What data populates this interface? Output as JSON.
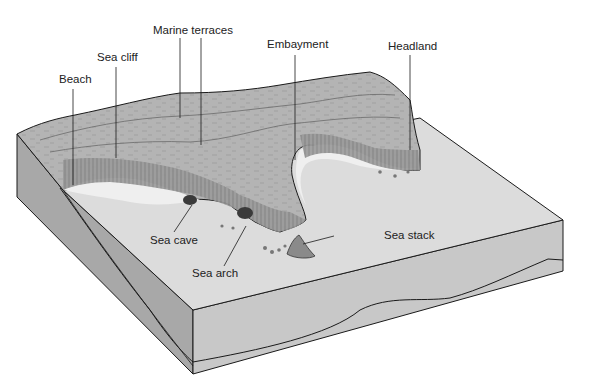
{
  "diagram": {
    "colors": {
      "background": "#ffffff",
      "sea_floor": "#dcdcdc",
      "land_top": "#b4b4b4",
      "terrace": "#c2c2c2",
      "cliff_face": "#9a9a9a",
      "beach": "#efefef",
      "front_face": "#c8c8c8",
      "left_face": "#a8a8a8",
      "outline": "#1a1a1a"
    },
    "labels": [
      {
        "id": "marine-terraces",
        "text": "Marine terraces",
        "x": 153,
        "y": 25
      },
      {
        "id": "sea-cliff",
        "text": "Sea cliff",
        "x": 97,
        "y": 52
      },
      {
        "id": "beach",
        "text": "Beach",
        "x": 59,
        "y": 74
      },
      {
        "id": "embayment",
        "text": "Embayment",
        "x": 267,
        "y": 39
      },
      {
        "id": "headland",
        "text": "Headland",
        "x": 388,
        "y": 41
      },
      {
        "id": "sea-cave",
        "text": "Sea cave",
        "x": 150,
        "y": 235
      },
      {
        "id": "sea-arch",
        "text": "Sea arch",
        "x": 192,
        "y": 268
      },
      {
        "id": "sea-stack",
        "text": "Sea stack",
        "x": 384,
        "y": 230
      }
    ]
  }
}
